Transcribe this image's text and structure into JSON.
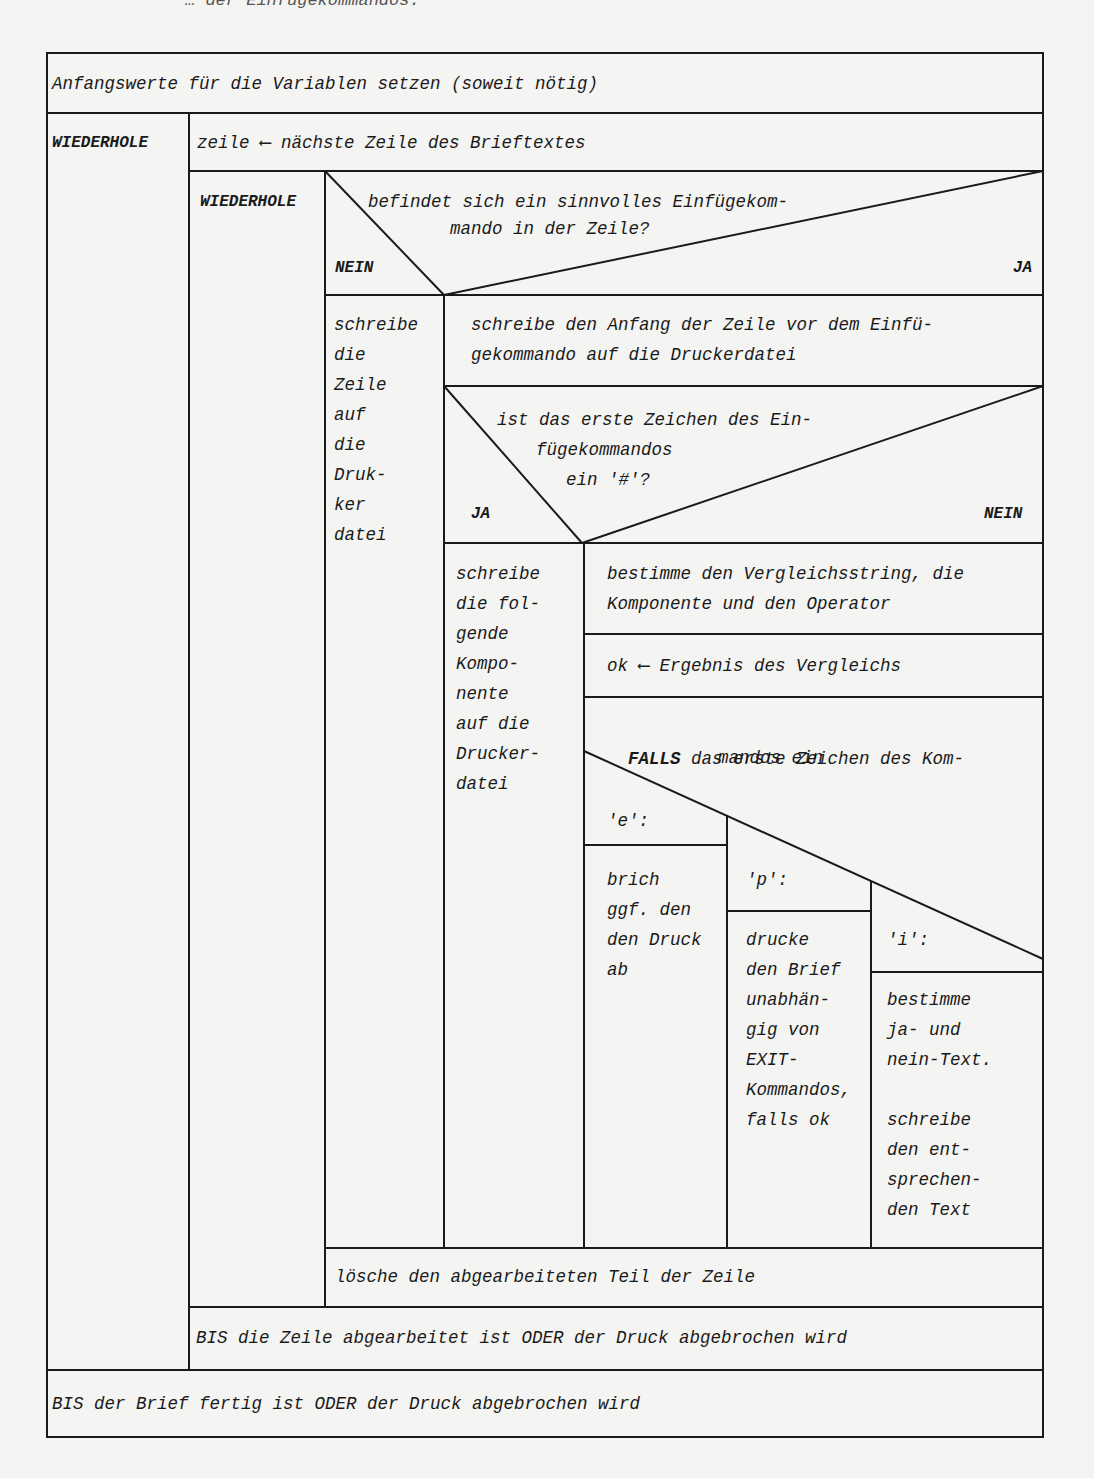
{
  "header": {
    "cropped_text": "… der Einfügekommandos:"
  },
  "diagram": {
    "init": "Anfangswerte für die Variablen setzen (soweit nötig)",
    "outer_loop": {
      "keyword": "WIEDERHOLE",
      "first_step": "zeile ⟵ nächste Zeile des Brieftextes",
      "inner_loop": {
        "keyword": "WIEDERHOLE",
        "decision": {
          "question_line1": "befindet sich ein sinnvolles Einfügekom-",
          "question_line2": "mando in der Zeile?",
          "no_label": "NEIN",
          "yes_label": "JA",
          "no_branch_lines": [
            "schreibe",
            "die",
            "Zeile",
            "auf",
            "die",
            "Druk-",
            "ker",
            "datei"
          ],
          "yes_branch": {
            "step1_line1": "schreibe den Anfang der Zeile vor dem Einfü-",
            "step1_line2": "gekommando auf die Druckerdatei",
            "decision2": {
              "line1": "ist das erste Zeichen des Ein-",
              "line2": "fügekommandos",
              "line3": "ein '#'?",
              "yes_label": "JA",
              "no_label": "NEIN",
              "yes_branch_lines": [
                "schreibe",
                "die fol-",
                "gende",
                "Kompo-",
                "nente",
                "auf die",
                "Drucker-",
                "datei"
              ],
              "no_branch": {
                "step1_line1": "bestimme den Vergleichsstring, die",
                "step1_line2": "Komponente und den Operator",
                "step2": "ok ⟵ Ergebnis des Vergleichs",
                "case": {
                  "keyword": "FALLS",
                  "line1_rest": " das erste Zeichen des Kom-",
                  "line2": "mandos ein",
                  "cases": [
                    {
                      "label": "'e':",
                      "lines": [
                        "brich",
                        "ggf. den",
                        "den Druck",
                        "ab"
                      ]
                    },
                    {
                      "label": "'p':",
                      "lines": [
                        "drucke",
                        "den Brief",
                        "unabhän-",
                        "gig von",
                        "EXIT-",
                        "Kommandos,",
                        "falls ok"
                      ]
                    },
                    {
                      "label": "'i':",
                      "lines": [
                        "bestimme",
                        "ja- und",
                        "nein-Text.",
                        "",
                        "schreibe",
                        "den ent-",
                        "sprechen-",
                        "den Text"
                      ]
                    }
                  ]
                }
              }
            }
          }
        },
        "after_decision": "lösche den abgearbeiteten Teil der Zeile",
        "until": "BIS die Zeile abgearbeitet ist ODER der Druck abgebrochen wird"
      },
      "until": "BIS der Brief fertig ist ODER der Druck abgebrochen wird"
    }
  },
  "colors": {
    "paper": "#f4f4f2",
    "ink": "#1a1a1a"
  }
}
